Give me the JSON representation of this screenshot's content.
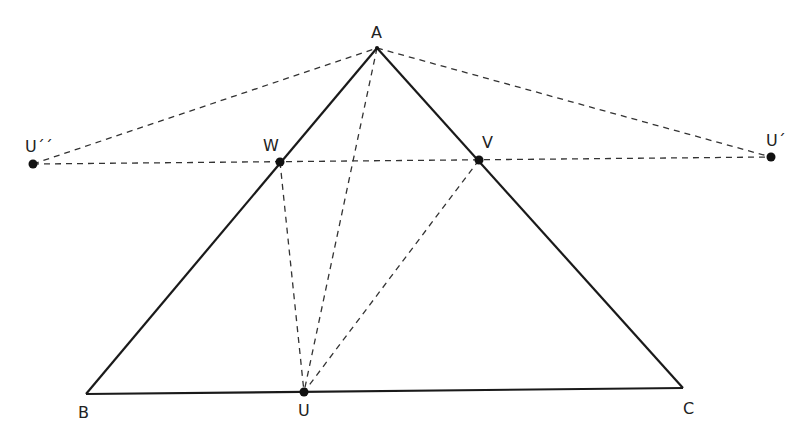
{
  "diagram": {
    "colors": {
      "stroke": "#1a1a1a",
      "dashed": "#333333",
      "point": "#111111"
    },
    "points": {
      "A": {
        "label": "A",
        "x": 377,
        "y": 48
      },
      "B": {
        "label": "B",
        "x": 86,
        "y": 394
      },
      "C": {
        "label": "C",
        "x": 683,
        "y": 388
      },
      "U": {
        "label": "U",
        "x": 304,
        "y": 392
      },
      "W": {
        "label": "W",
        "x": 280,
        "y": 162
      },
      "V": {
        "label": "V",
        "x": 479,
        "y": 160
      },
      "U2": {
        "label": "U´´",
        "x": 33,
        "y": 164
      },
      "U1": {
        "label": "U´",
        "x": 771,
        "y": 157
      }
    },
    "solid_segments": [
      [
        "A",
        "B"
      ],
      [
        "A",
        "C"
      ],
      [
        "B",
        "C"
      ]
    ],
    "dashed_segments": [
      [
        "U2",
        "A"
      ],
      [
        "A",
        "U1"
      ],
      [
        "U2",
        "U1"
      ],
      [
        "W",
        "U"
      ],
      [
        "V",
        "U"
      ],
      [
        "A",
        "U"
      ]
    ],
    "labels": {
      "A": "A",
      "B": "B",
      "C": "C",
      "U": "U",
      "W": "W",
      "V": "V",
      "U1": "U´",
      "U2": "U´´"
    }
  }
}
